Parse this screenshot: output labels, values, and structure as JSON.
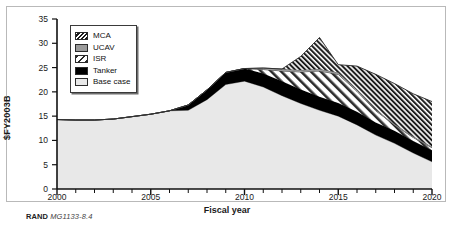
{
  "figure": {
    "caption_prefix": "RAND",
    "caption_number": "MG1133-8.4"
  },
  "chart_data": {
    "type": "area",
    "stacked": true,
    "title": "",
    "xlabel": "Fiscal year",
    "ylabel": "$FY2003B",
    "xlim": [
      2000,
      2020
    ],
    "ylim": [
      0,
      35
    ],
    "xticks": [
      2000,
      2005,
      2010,
      2015,
      2020
    ],
    "yticks": [
      0,
      5,
      10,
      15,
      20,
      25,
      30,
      35
    ],
    "xtick_labels": [
      "2000",
      "2005",
      "2010",
      "2015",
      "2020"
    ],
    "ytick_labels": [
      "0",
      "5",
      "10",
      "15",
      "20",
      "25",
      "30",
      "35"
    ],
    "minor_xtick_interval": 1,
    "grid": false,
    "legend_position": "upper-left-inside",
    "x": [
      2000,
      2001,
      2002,
      2003,
      2004,
      2005,
      2006,
      2007,
      2008,
      2009,
      2010,
      2011,
      2012,
      2013,
      2014,
      2015,
      2016,
      2017,
      2018,
      2019,
      2020
    ],
    "series": [
      {
        "name": "Base case",
        "fill": "#e8e8e8",
        "pattern": "solid-light",
        "values": [
          14.3,
          14.2,
          14.2,
          14.4,
          14.9,
          15.4,
          16.1,
          16.2,
          18.4,
          21.5,
          22.2,
          21.0,
          19.2,
          17.6,
          16.2,
          15.0,
          13.2,
          11.1,
          9.4,
          7.4,
          5.6
        ]
      },
      {
        "name": "Tanker",
        "fill": "#000000",
        "pattern": "solid-black",
        "values": [
          0.0,
          0.0,
          0.0,
          0.0,
          0.0,
          0.0,
          0.0,
          1.1,
          2.0,
          2.5,
          2.6,
          2.8,
          3.0,
          2.9,
          2.8,
          2.7,
          2.7,
          2.6,
          2.6,
          2.5,
          2.4
        ]
      },
      {
        "name": "ISR",
        "fill": "#ffffff",
        "pattern": "diagonal-hatch-wide",
        "values": [
          0.0,
          0.0,
          0.0,
          0.0,
          0.0,
          0.0,
          0.0,
          0.0,
          0.0,
          0.0,
          0.0,
          0.8,
          2.1,
          3.6,
          5.3,
          5.9,
          4.2,
          2.4,
          1.2,
          0.7,
          0.5
        ]
      },
      {
        "name": "UCAV",
        "fill": "#9a9a9a",
        "pattern": "solid-gray",
        "values": [
          0.0,
          0.0,
          0.0,
          0.0,
          0.0,
          0.0,
          0.0,
          0.0,
          0.0,
          0.0,
          0.0,
          0.3,
          0.4,
          0.4,
          0.4,
          0.4,
          0.3,
          0.2,
          0.2,
          0.2,
          0.2
        ]
      },
      {
        "name": "MCA",
        "fill": "#ffffff",
        "pattern": "diagonal-hatch-dense",
        "values": [
          0.0,
          0.0,
          0.0,
          0.0,
          0.0,
          0.0,
          0.0,
          0.0,
          0.0,
          0.0,
          0.0,
          0.0,
          0.0,
          2.8,
          6.5,
          1.6,
          4.9,
          7.3,
          8.3,
          8.8,
          9.3
        ]
      }
    ]
  },
  "legend": {
    "items": [
      {
        "label": "MCA"
      },
      {
        "label": "UCAV"
      },
      {
        "label": "ISR"
      },
      {
        "label": "Tanker"
      },
      {
        "label": "Base case"
      }
    ]
  }
}
